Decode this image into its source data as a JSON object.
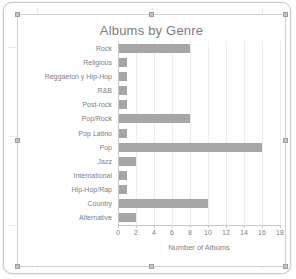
{
  "window": {
    "frame_name": "spreadsheet-canvas",
    "chart_selected": true
  },
  "chart_data": {
    "type": "bar",
    "orientation": "horizontal",
    "title": "Albums by Genre",
    "xlabel": "Number of Albums",
    "ylabel": "",
    "categories": [
      "Rock",
      "Religious",
      "Reggaeton y Hip-Hop",
      "R&B",
      "Post-rock",
      "Pop/Rock",
      "Pop Latino",
      "Pop",
      "Jazz",
      "International",
      "Hip-Hop/Rap",
      "Country",
      "Alternative"
    ],
    "values": [
      8,
      1,
      1,
      1,
      1,
      8,
      1,
      16,
      2,
      1,
      1,
      10,
      2
    ],
    "xlim": [
      0,
      18
    ],
    "xticks": [
      0,
      2,
      4,
      6,
      8,
      10,
      12,
      14,
      16,
      18
    ],
    "grid": true,
    "legend": false,
    "bar_color": "#a6a6a6",
    "text_color": "#808080",
    "title_color": "#7b7b7b",
    "gridline_color": "#ededed"
  }
}
